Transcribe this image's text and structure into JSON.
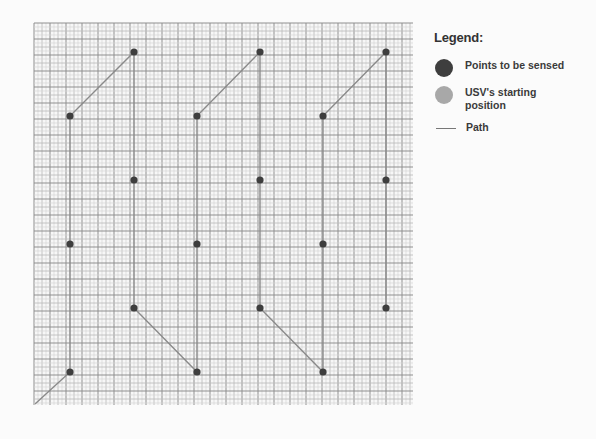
{
  "figure": {
    "grid": {
      "left": 34,
      "top": 23,
      "right": 413,
      "bottom": 405,
      "fine_step": 4,
      "mid_step": 8,
      "major_step": 16,
      "fine_color": "#d6d6d6",
      "mid_color": "#bdbdbd",
      "major_color": "#8f8f8f",
      "background": "#f7f7f7"
    },
    "path": {
      "color": "#8a8a8a",
      "width": 1.4,
      "points": [
        [
          35,
          404
        ],
        [
          70,
          372
        ],
        [
          70,
          116
        ],
        [
          134,
          52
        ],
        [
          134,
          180
        ],
        [
          134,
          308
        ],
        [
          197,
          372
        ],
        [
          197,
          244
        ],
        [
          197,
          116
        ],
        [
          260,
          52
        ],
        [
          260,
          180
        ],
        [
          260,
          308
        ],
        [
          323,
          372
        ],
        [
          323,
          244
        ],
        [
          323,
          116
        ],
        [
          386,
          52
        ],
        [
          386,
          180
        ],
        [
          386,
          308
        ]
      ]
    },
    "sensed_points": {
      "color": "#3e3e3e",
      "radius": 3.6,
      "points": [
        [
          70,
          372
        ],
        [
          70,
          244
        ],
        [
          70,
          116
        ],
        [
          134,
          52
        ],
        [
          134,
          180
        ],
        [
          134,
          308
        ],
        [
          197,
          372
        ],
        [
          197,
          244
        ],
        [
          197,
          116
        ],
        [
          260,
          52
        ],
        [
          260,
          180
        ],
        [
          260,
          308
        ],
        [
          323,
          372
        ],
        [
          323,
          244
        ],
        [
          323,
          116
        ],
        [
          386,
          52
        ],
        [
          386,
          180
        ],
        [
          386,
          308
        ]
      ]
    },
    "start_position": {
      "x": 35,
      "y": 404,
      "color": "#9a9a9a"
    }
  },
  "legend": {
    "title": "Legend:",
    "items": [
      {
        "icon": "dark-circle-icon",
        "color": "#3e3e3e",
        "label": "Points to be sensed"
      },
      {
        "icon": "gray-circle-icon",
        "color": "#a8a8a8",
        "label": "USV's starting position"
      },
      {
        "icon": "line-icon",
        "color": "#777777",
        "label": "Path"
      }
    ]
  }
}
